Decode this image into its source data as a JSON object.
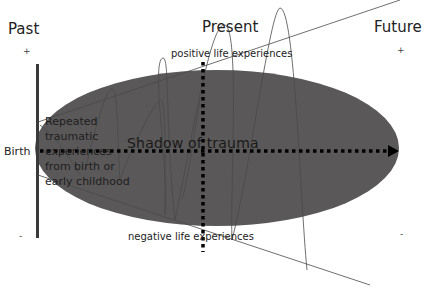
{
  "timeline": {
    "past": "Past",
    "present": "Present",
    "future": "Future"
  },
  "axis_signs": {
    "past_plus": "+",
    "future_plus": "+",
    "past_minus": "-",
    "future_minus": "-"
  },
  "labels": {
    "birth": "Birth",
    "positive": "positive life experiences",
    "negative": "negative life experiences",
    "shadow": "Shadow of trauma",
    "repeated_trauma": "Repeated traumatic experiences from birth or early childhood"
  },
  "colors": {
    "ellipse_fill": "#5a5858",
    "axis_bar": "#3a3a3a",
    "dotted": "#000000",
    "thin_lines": "#555555"
  }
}
